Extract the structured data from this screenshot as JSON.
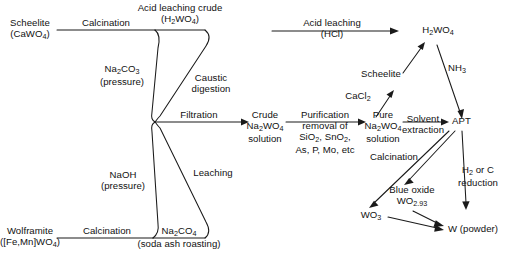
{
  "figure": {
    "kind": "process-flow-diagram",
    "background_color": "#ffffff",
    "line_color": "#1a1a1a",
    "text_color": "#111111"
  },
  "nodes": {
    "scheelite_ore": "Scheelite\n(CaWO4)",
    "scheelite_ore_l1": "Scheelite",
    "scheelite_ore_l2_pre": "(CaWO",
    "scheelite_ore_l2_sub": "4",
    "scheelite_ore_l2_post": ")",
    "wolframite_ore_l1": "Wolframite",
    "wolframite_ore_l2_pre": "([Fe,Mn]WO",
    "wolframite_ore_l2_sub": "4",
    "wolframite_ore_l2_post": ")",
    "acid_leach_crude_l1": "Acid leaching crude",
    "acid_leach_crude_l2_pre": "(H",
    "acid_leach_crude_l2_sub1": "2",
    "acid_leach_crude_l2_mid": "WO",
    "acid_leach_crude_l2_sub2": "4",
    "acid_leach_crude_l2_post": ")",
    "soda_ash_l1_pre": "Na",
    "soda_ash_l1_sub1": "2",
    "soda_ash_l1_mid": "CO",
    "soda_ash_l1_sub2": "4",
    "soda_ash_l2": "(soda ash roasting)",
    "crude_solution_l1": "Crude",
    "crude_solution_l2_pre": "Na",
    "crude_solution_l2_sub1": "2",
    "crude_solution_l2_mid": "WO",
    "crude_solution_l2_sub2": "4",
    "crude_solution_l3": "solution",
    "pure_solution_l1": "Pure",
    "pure_solution_l2_pre": "Na",
    "pure_solution_l2_sub1": "2",
    "pure_solution_l2_mid": "WO",
    "pure_solution_l2_sub2": "4",
    "pure_solution_l3": "solution",
    "scheelite_intermediate": "Scheelite",
    "tungstic_acid_pre": "H",
    "tungstic_acid_sub1": "2",
    "tungstic_acid_mid": "WO",
    "tungstic_acid_sub2": "4",
    "apt": "APT",
    "blue_oxide_l1": "Blue oxide",
    "blue_oxide_l2_pre": "WO",
    "blue_oxide_l2_sub": "2.93",
    "tungsten_trioxide_pre": "WO",
    "tungsten_trioxide_sub": "3",
    "tungsten_powder": "W (powder)"
  },
  "edge_labels": {
    "calcination_top": "Calcination",
    "calcination_bottom": "Calcination",
    "sodium_carbonate_l1_pre": "Na",
    "sodium_carbonate_l1_sub1": "2",
    "sodium_carbonate_l1_mid": "CO",
    "sodium_carbonate_l1_sub2": "3",
    "sodium_carbonate_l2": "(pressure)",
    "sodium_hydroxide_l1": "NaOH",
    "sodium_hydroxide_l2": "(pressure)",
    "caustic_digestion_l1": "Caustic",
    "caustic_digestion_l2": "digestion",
    "leaching": "Leaching",
    "filtration": "Filtration",
    "purification_l1": "Purification",
    "purification_l2": "removal of",
    "purification_l3_pre": "SiO",
    "purification_l3_sub1": "2",
    "purification_l3_mid": ", SnO",
    "purification_l3_sub2": "2",
    "purification_l3_post": ",",
    "purification_l4": "As, P, Mo, etc",
    "acid_leaching_l1": "Acid leaching",
    "acid_leaching_l2": "(HCl)",
    "calcium_chloride_pre": "CaCl",
    "calcium_chloride_sub": "2",
    "solvent_extraction_l1": "Solvent",
    "solvent_extraction_l2": "extraction",
    "ammonia_pre": "NH",
    "ammonia_sub": "3",
    "calcination_apt": "Calcination",
    "reduction_l1_pre": "H",
    "reduction_l1_sub": "2",
    "reduction_l1_post": " or C",
    "reduction_l2": "reduction"
  }
}
